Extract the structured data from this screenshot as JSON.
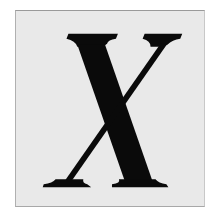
{
  "tile": {
    "letter": "X",
    "background": "#e9e9e9",
    "letter_color": "#0a0a0a"
  }
}
